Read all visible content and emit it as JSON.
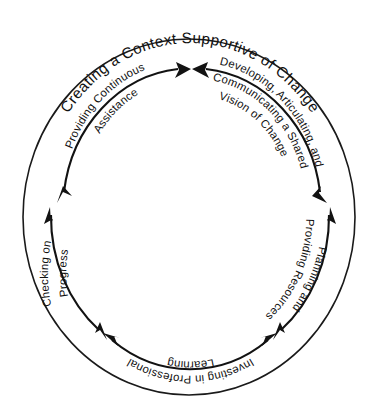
{
  "diagram": {
    "name": "change-leadership-cycle",
    "title": "Creating a Context Supportive of Change",
    "shape": "circular-cycle",
    "background_color": "#ffffff",
    "line_color": "#121212",
    "text_color": "#111111",
    "segment_count": 6,
    "arrow_style": "double-headed-curved",
    "segments": [
      {
        "id": "developing-vision",
        "position": "upper-right",
        "line1": "Developing, Articulating, and",
        "line2": "Communicating a Shared",
        "line3": "Vision of Change"
      },
      {
        "id": "planning-resources",
        "position": "right",
        "line1": "Planning and",
        "line2": "Providing Resources"
      },
      {
        "id": "investing-professional-learning",
        "position": "bottom",
        "line1": "Investing in Professional",
        "line2": "Learning"
      },
      {
        "id": "checking-progress",
        "position": "left",
        "line1": "Checking on",
        "line2": "Progress"
      },
      {
        "id": "providing-assistance",
        "position": "upper-left",
        "line1": "Providing Continuous",
        "line2": "Assistance"
      }
    ]
  }
}
